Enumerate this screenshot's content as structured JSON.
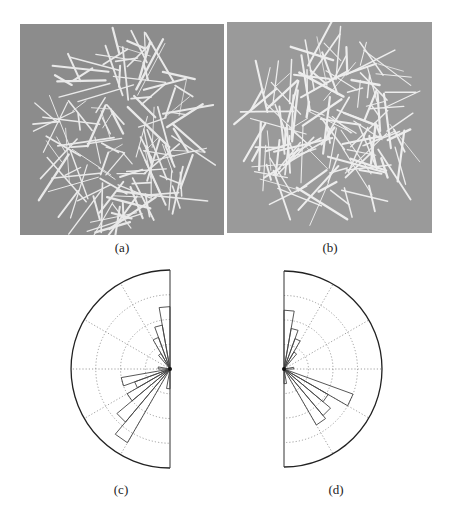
{
  "figure": {
    "panels": [
      {
        "id": "a",
        "caption": "(a)",
        "kind": "micrograph",
        "background": "#8c8c8c"
      },
      {
        "id": "b",
        "caption": "(b)",
        "kind": "micrograph",
        "background": "#999999"
      },
      {
        "id": "c",
        "caption": "(c)",
        "kind": "polar-histogram"
      },
      {
        "id": "d",
        "caption": "(d)",
        "kind": "polar-histogram"
      }
    ]
  },
  "chart_data": [
    {
      "panel": "c",
      "type": "bar",
      "subtype": "polar-half-rose",
      "title": "",
      "orientation": "left half (angles 0-180 from top to bottom)",
      "bin_width_deg": 10,
      "categories": [
        "0-10",
        "10-20",
        "20-30",
        "30-40",
        "40-50",
        "50-60",
        "60-70",
        "70-80",
        "80-90",
        "90-100",
        "100-110",
        "110-120",
        "120-130",
        "130-140",
        "140-150",
        "150-160",
        "160-170",
        "170-180"
      ],
      "values": [
        0.63,
        0.45,
        0.34,
        0.18,
        0.0,
        0.0,
        0.0,
        0.0,
        0.12,
        0.0,
        0.5,
        0.38,
        0.5,
        0.7,
        0.86,
        0.0,
        0.0,
        0.2
      ],
      "rlim": [
        0,
        1
      ],
      "grid": {
        "rings": 4,
        "spoke_deg": 30,
        "style": "dotted"
      }
    },
    {
      "panel": "d",
      "type": "bar",
      "subtype": "polar-half-rose",
      "title": "",
      "orientation": "right half (angles 0-180 from top to bottom)",
      "bin_width_deg": 10,
      "categories": [
        "0-10",
        "10-20",
        "20-30",
        "30-40",
        "40-50",
        "50-60",
        "60-70",
        "70-80",
        "80-90",
        "90-100",
        "100-110",
        "110-120",
        "120-130",
        "130-140",
        "140-150",
        "150-160",
        "160-170",
        "170-180"
      ],
      "values": [
        0.6,
        0.42,
        0.33,
        0.2,
        0.0,
        0.0,
        0.0,
        0.0,
        0.1,
        0.0,
        0.0,
        0.75,
        0.52,
        0.62,
        0.66,
        0.0,
        0.0,
        0.15
      ],
      "rlim": [
        0,
        1
      ],
      "grid": {
        "rings": 4,
        "spoke_deg": 30,
        "style": "dotted"
      }
    }
  ]
}
